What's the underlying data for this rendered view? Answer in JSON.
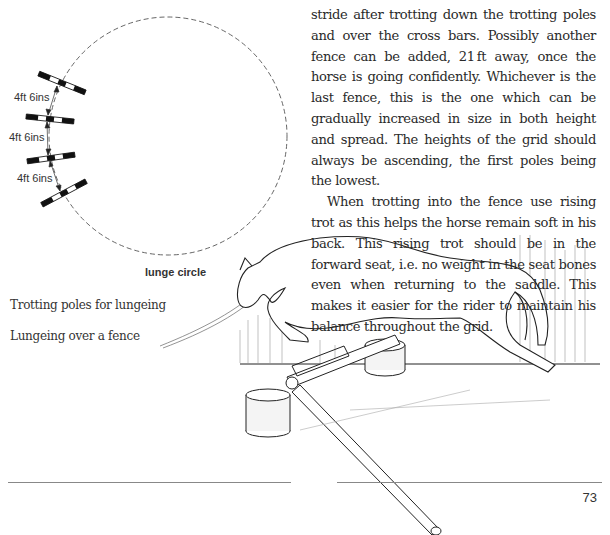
{
  "body_text": {
    "paragraphs": [
      "stride after trotting down the trotting poles and over the cross bars. Possibly another fence can be added, 21 ft away, once the horse is going confidently. Whichever is the last fence, this is the one which can be gradually increased in size in both height and spread. The heights of the grid should always be ascending, the first poles being the lowest.",
      "When trotting into the fence use rising trot as this helps the horse remain soft in his back. This rising trot should be in the forward seat, i.e. no weight in the seat bones even when returning to the saddle. This makes it easier for the rider to maintain his balance throughout the grid."
    ]
  },
  "diagram": {
    "distance_labels": [
      "4ft 6ins",
      "4ft 6ins",
      "4ft 6ins"
    ],
    "circle_label": "lunge circle"
  },
  "captions": {
    "trotting_poles": "Trotting poles for lungeing",
    "lungeing_fence": "Lungeing over a fence"
  },
  "footer": {
    "page_number": "73"
  }
}
